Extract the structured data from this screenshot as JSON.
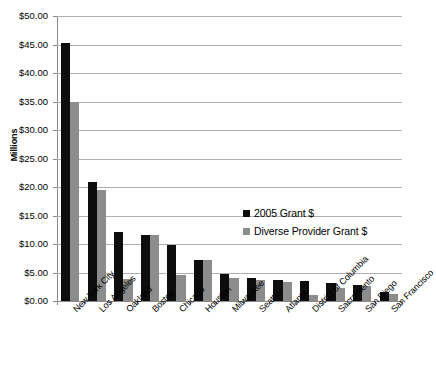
{
  "chart_data": {
    "type": "bar",
    "title": "",
    "xlabel": "",
    "ylabel": "Millions",
    "ylim": [
      0,
      50
    ],
    "ytick_step": 5,
    "ytick_labels": [
      "$0.00",
      "$5.00",
      "$10.00",
      "$15.00",
      "$20.00",
      "$25.00",
      "$30.00",
      "$35.00",
      "$40.00",
      "$45.00",
      "$50.00"
    ],
    "grid": true,
    "legend_position": "inside-upper-right",
    "categories": [
      "New York City",
      "Los Angeles",
      "Oakland",
      "Boston",
      "Chicago",
      "Houston",
      "Milwaukee",
      "Seattle",
      "Atlanta",
      "District of Columbia",
      "Sacramento",
      "San Diego",
      "San Francisco"
    ],
    "series": [
      {
        "name": "2005 Grant $",
        "color": "#0d0d0d",
        "values": [
          45.2,
          20.8,
          12.1,
          11.5,
          9.9,
          7.2,
          4.8,
          4.1,
          3.7,
          3.5,
          3.1,
          2.8,
          1.5
        ]
      },
      {
        "name": "Diverse Provider Grant $",
        "color": "#8c8c8c",
        "values": [
          35.0,
          19.5,
          3.9,
          11.5,
          4.6,
          7.2,
          4.0,
          3.6,
          3.4,
          1.1,
          2.3,
          2.7,
          1.2
        ]
      }
    ]
  }
}
